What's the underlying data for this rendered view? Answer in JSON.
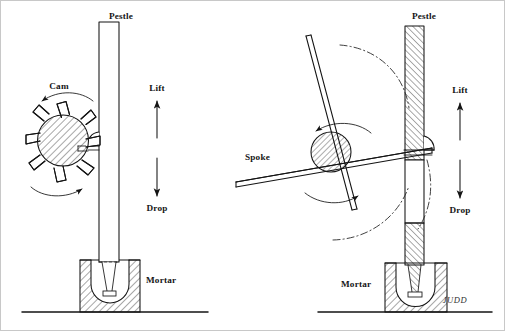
{
  "figure": {
    "signature": "JUDD",
    "background_color": "#ffffff",
    "ink_color": "#141414",
    "frame_color": "#c8c8c8"
  },
  "left_figure": {
    "name": "cam-driven pestle",
    "labels": {
      "pestle": "Pestle",
      "cam": "Cam",
      "lift": "Lift",
      "drop": "Drop",
      "mortar": "Mortar"
    },
    "cam": {
      "teeth": 8,
      "hatched": true,
      "rotation": "counter-clockwise"
    }
  },
  "right_figure": {
    "name": "spoke-driven pestle",
    "labels": {
      "pestle": "Pestle",
      "spoke": "Spoke",
      "lift": "Lift",
      "drop": "Drop",
      "mortar": "Mortar"
    },
    "hub": {
      "spokes": 4,
      "hatched": true,
      "rotation": "counter-clockwise"
    }
  }
}
